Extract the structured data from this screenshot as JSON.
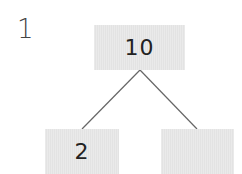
{
  "question_number": "1",
  "tree": {
    "root": {
      "value": "10"
    },
    "left_child": {
      "value": "2"
    },
    "right_child": {
      "value": ""
    }
  },
  "colors": {
    "box_fill": "#e3e3e3",
    "line": "#666666",
    "text": "#222222"
  }
}
